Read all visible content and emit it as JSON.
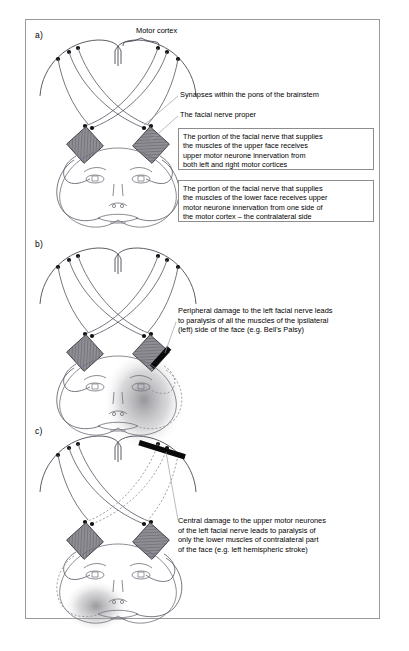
{
  "page": {
    "header_right": "",
    "figure_border_color": "#9a9a9a"
  },
  "panels": [
    {
      "id": "a",
      "letter": "a)",
      "labels": [
        {
          "name": "motor-cortex",
          "text": "Motor cortex"
        },
        {
          "name": "synapses-pons",
          "text": "Synapses within the pons of the brainstem"
        },
        {
          "name": "facial-nerve-proper",
          "text": "The facial nerve proper"
        }
      ],
      "textboxes": [
        {
          "name": "upper-face-innervation-box",
          "text": "The portion of the facial nerve that supplies\nthe muscles of the upper face receives\nupper motor neurone innervation from\nboth left and right motor cortices"
        },
        {
          "name": "lower-face-innervation-box",
          "text": "The portion of the facial nerve that supplies\nthe muscles of the lower face receives upper\nmotor neurone innervation from one side of\nthe motor cortex – the contralateral side"
        }
      ]
    },
    {
      "id": "b",
      "letter": "b)",
      "labels": [
        {
          "name": "peripheral-damage-note",
          "text": "Peripheral damage to the left facial nerve leads\nto paralysis of all the muscles of the ipsilateral\n(left) side of the face (e.g. Bell's Palsy)"
        }
      ],
      "textboxes": []
    },
    {
      "id": "c",
      "letter": "c)",
      "labels": [
        {
          "name": "central-damage-note",
          "text": "Central damage to the upper motor neurones\nof the left facial nerve leads to paralysis of\nonly the lower muscles of contralateral part\nof the face (e.g. left hemispheric stroke)"
        }
      ],
      "textboxes": []
    }
  ],
  "legend_colors": {
    "pons_fill": "#8e8e94",
    "nerve_stroke": "#5f5f6a",
    "lesion_black": "#0a0a0a",
    "paralysis_shade": "#6f6f75",
    "box_border": "#8d8d8d"
  }
}
